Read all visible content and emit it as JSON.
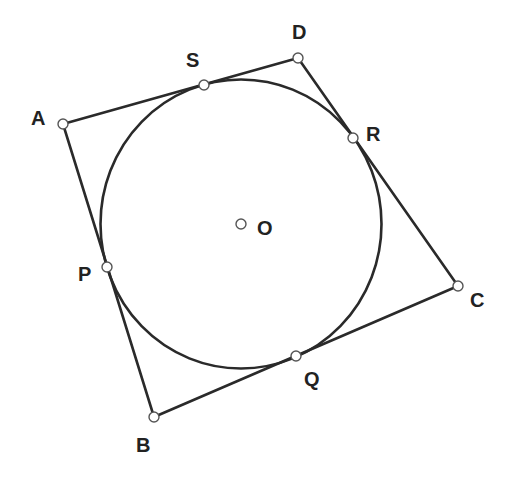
{
  "diagram": {
    "quadrilateral": [
      "A",
      "B",
      "C",
      "D"
    ],
    "circle_center": "O",
    "tangent_points": [
      {
        "name": "P",
        "side": "AB"
      },
      {
        "name": "Q",
        "side": "BC"
      },
      {
        "name": "R",
        "side": "CD"
      },
      {
        "name": "S",
        "side": "DA"
      }
    ],
    "labels": {
      "A": "A",
      "B": "B",
      "C": "C",
      "D": "D",
      "O": "O",
      "P": "P",
      "Q": "Q",
      "R": "R",
      "S": "S"
    },
    "colors": {
      "stroke": "#2a2a2a",
      "point_fill": "#ffffff",
      "label": "#222222"
    }
  }
}
